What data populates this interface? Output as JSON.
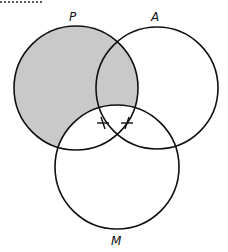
{
  "diagram": {
    "type": "venn",
    "sets": [
      {
        "id": "P",
        "label": "P",
        "cx": 76,
        "cy": 88,
        "r": 62
      },
      {
        "id": "A",
        "label": "A",
        "cx": 157,
        "cy": 88,
        "r": 61
      },
      {
        "id": "M",
        "label": "M",
        "cx": 117,
        "cy": 167,
        "r": 62
      }
    ],
    "shaded_region": "P minus M",
    "shade_color": "#c9c9c9",
    "stroke_color": "#111111",
    "marks": [
      {
        "type": "cross",
        "x": 103,
        "y": 123
      },
      {
        "type": "cross",
        "x": 127,
        "y": 123
      }
    ]
  }
}
